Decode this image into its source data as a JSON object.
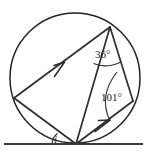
{
  "figure": {
    "type": "circle-geometry-diagram",
    "background_color": "#ffffff",
    "line_color": "#2e2e2e",
    "canvas": {
      "width": 147,
      "height": 152
    }
  },
  "circle": {
    "name": "main-circle",
    "center_x": 75,
    "center_y": 78,
    "radius": 65,
    "stroke": "#232323"
  },
  "points": [
    {
      "id": "T",
      "label": "top-vertex",
      "x": 110,
      "y": 27,
      "on_circle": true
    },
    {
      "id": "L",
      "label": "left-vertex",
      "x": 14,
      "y": 98,
      "on_circle": true
    },
    {
      "id": "B",
      "label": "bottom-tangent-vertex",
      "x": 76,
      "y": 144,
      "on_circle": true
    },
    {
      "id": "R",
      "label": "right-vertex",
      "x": 133,
      "y": 101,
      "on_circle": true
    }
  ],
  "chords": [
    {
      "name": "chord-left-to-top",
      "from": "L",
      "to": "T",
      "arrow": true,
      "arrow_position": "midpoint",
      "arrow_direction": "toward-top"
    },
    {
      "name": "chord-bottom-to-top",
      "from": "B",
      "to": "T",
      "arrow": false
    },
    {
      "name": "chord-bottom-to-right",
      "from": "B",
      "to": "R",
      "arrow": true,
      "arrow_position": "midpoint",
      "arrow_direction": "toward-right"
    },
    {
      "name": "chord-left-to-bottom",
      "from": "L",
      "to": "B",
      "arrow": false
    },
    {
      "name": "chord-top-to-right",
      "from": "T",
      "to": "R",
      "arrow": false
    }
  ],
  "tangent": {
    "name": "tangent-line",
    "x1": 4,
    "y1": 144,
    "x2": 143,
    "y2": 144,
    "touch_point": "B"
  },
  "angles": [
    {
      "id": "angle-36",
      "value": "36",
      "unit": "°",
      "text": "36°",
      "vertex": "T",
      "label_x": 95,
      "label_y": 58,
      "description": "angle at top vertex between chord to left vertex and chord to bottom vertex"
    },
    {
      "id": "angle-101",
      "value": "101",
      "unit": "°",
      "text": "101°",
      "vertex": "R",
      "label_x": 103,
      "label_y": 101,
      "description": "angle at right vertex between chord to top vertex and chord to bottom vertex"
    },
    {
      "id": "angle-i",
      "value": "i",
      "unit": "",
      "text": "i",
      "vertex": "B",
      "label_x": 55,
      "label_y": 143,
      "description": "unknown angle between tangent line and chord to left vertex"
    }
  ],
  "labels": {
    "angle_36": "36°",
    "angle_101": "101°",
    "angle_i": "i"
  }
}
